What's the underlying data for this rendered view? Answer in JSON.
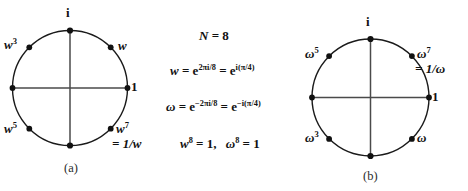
{
  "figure": {
    "background": "#ffffff",
    "ink": "#111111",
    "width": 468,
    "height": 191
  },
  "panel_a": {
    "caption": "(a)",
    "center": {
      "x": 70,
      "y": 88
    },
    "radius": 57.5,
    "labels": {
      "top_i": "i",
      "right_one": "1",
      "w": "w",
      "w3_base": "w",
      "w3_exp": "3",
      "w5_base": "w",
      "w5_exp": "5",
      "w7_base": "w",
      "w7_exp": "7",
      "w7_equals": "= 1/w"
    },
    "points_deg": [
      0,
      45,
      90,
      135,
      180,
      225,
      270,
      315
    ]
  },
  "panel_b": {
    "caption": "(b)",
    "center": {
      "x": 370.5,
      "y": 97.5
    },
    "radius": 58.5,
    "labels": {
      "top_i": "i",
      "right_one": "1",
      "omega": "ω",
      "omega3_base": "ω",
      "omega3_exp": "3",
      "omega5_base": "ω",
      "omega5_exp": "5",
      "omega7_base": "ω",
      "omega7_exp": "7",
      "omega7_equals": "= 1/ω"
    },
    "points_deg": [
      0,
      45,
      90,
      135,
      180,
      225,
      270,
      315
    ]
  },
  "equations": {
    "line1": {
      "lhs": "N",
      "eq": "=",
      "rhs": "8"
    },
    "line2": {
      "var": "w",
      "eq1": "=",
      "base1": "e",
      "exp1": "2πi/8",
      "eq2": "=",
      "base2": "e",
      "exp2": "i(π/4)"
    },
    "line3": {
      "var": "ω",
      "eq1": "=",
      "base1": "e",
      "exp1": "−2πi/8",
      "eq2": "=",
      "base2": "e",
      "exp2": "−i(π/4)"
    },
    "line4": {
      "var1": "w",
      "exp1": "8",
      "eq1": "= 1,",
      "var2": "ω",
      "exp2": "8",
      "eq2": "= 1"
    }
  }
}
